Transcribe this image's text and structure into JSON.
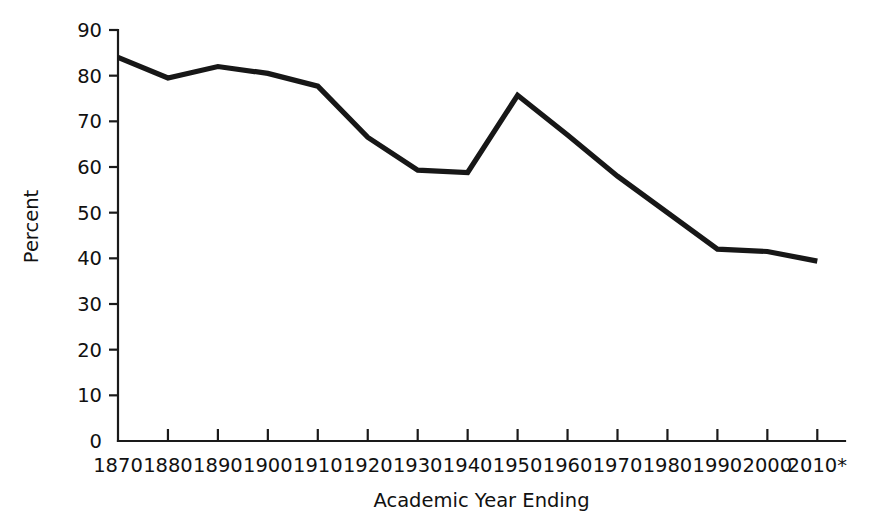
{
  "chart_data": {
    "type": "line",
    "title": "",
    "subtitle": "",
    "xlabel": "Academic Year Ending",
    "ylabel": "Percent",
    "categories": [
      "1870",
      "1880",
      "1890",
      "1900",
      "1910",
      "1920",
      "1930",
      "1940",
      "1950",
      "1960",
      "1970",
      "1980",
      "1990",
      "2000",
      "2010*"
    ],
    "values": [
      84,
      79.5,
      82,
      80.5,
      77.7,
      66.5,
      59.3,
      58.8,
      75.7,
      67,
      58,
      50,
      42,
      41.5,
      39.4
    ],
    "series": [
      {
        "name": "Percent",
        "values": [
          84,
          79.5,
          82,
          80.5,
          77.7,
          66.5,
          59.3,
          58.8,
          75.7,
          67,
          58,
          50,
          42,
          41.5,
          39.4
        ]
      }
    ],
    "ylim": [
      0,
      90
    ],
    "ytick_values": [
      0,
      10,
      20,
      30,
      40,
      50,
      60,
      70,
      80,
      90
    ],
    "ytick_labels": [
      "0",
      "10",
      "20",
      "30",
      "40",
      "50",
      "60",
      "70",
      "80",
      "90"
    ],
    "xtick_labels": [
      "1870",
      "1880",
      "1890",
      "1900",
      "1910",
      "1920",
      "1930",
      "1940",
      "1950",
      "1960",
      "1970",
      "1980",
      "1990",
      "2000",
      "2010*"
    ],
    "grid": false,
    "legend": false,
    "legend_position": "none",
    "line_color": "#171717",
    "axis_color": "#1a1a1a",
    "annotations": []
  }
}
